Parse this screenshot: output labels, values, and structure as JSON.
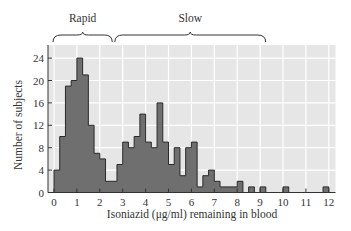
{
  "chart_data": {
    "type": "bar",
    "subtype": "histogram",
    "title": "",
    "xlabel": "Isoniazid (μg/ml) remaining in blood",
    "ylabel": "Number of subjects",
    "bin_width": 0.25,
    "xlim": [
      0,
      12.25
    ],
    "ylim": [
      0,
      25
    ],
    "xticks": [
      0,
      1,
      2,
      3,
      4,
      5,
      6,
      7,
      8,
      9,
      10,
      11,
      12
    ],
    "yticks": [
      0,
      4,
      8,
      12,
      16,
      20,
      24
    ],
    "grid": true,
    "bins": [
      {
        "x0": 0.0,
        "count": 4
      },
      {
        "x0": 0.25,
        "count": 10
      },
      {
        "x0": 0.5,
        "count": 19
      },
      {
        "x0": 0.75,
        "count": 20
      },
      {
        "x0": 1.0,
        "count": 24
      },
      {
        "x0": 1.25,
        "count": 21
      },
      {
        "x0": 1.5,
        "count": 12
      },
      {
        "x0": 1.75,
        "count": 7
      },
      {
        "x0": 2.0,
        "count": 6
      },
      {
        "x0": 2.25,
        "count": 2
      },
      {
        "x0": 2.5,
        "count": 2
      },
      {
        "x0": 2.75,
        "count": 5
      },
      {
        "x0": 3.0,
        "count": 9
      },
      {
        "x0": 3.25,
        "count": 8
      },
      {
        "x0": 3.5,
        "count": 10
      },
      {
        "x0": 3.75,
        "count": 14
      },
      {
        "x0": 4.0,
        "count": 9
      },
      {
        "x0": 4.25,
        "count": 8
      },
      {
        "x0": 4.5,
        "count": 16
      },
      {
        "x0": 4.75,
        "count": 9
      },
      {
        "x0": 5.0,
        "count": 5
      },
      {
        "x0": 5.25,
        "count": 8
      },
      {
        "x0": 5.5,
        "count": 3
      },
      {
        "x0": 5.75,
        "count": 8
      },
      {
        "x0": 6.0,
        "count": 9
      },
      {
        "x0": 6.25,
        "count": 1
      },
      {
        "x0": 6.5,
        "count": 3
      },
      {
        "x0": 6.75,
        "count": 4
      },
      {
        "x0": 7.0,
        "count": 2
      },
      {
        "x0": 7.25,
        "count": 1
      },
      {
        "x0": 7.5,
        "count": 1
      },
      {
        "x0": 7.75,
        "count": 1
      },
      {
        "x0": 8.0,
        "count": 2
      },
      {
        "x0": 8.5,
        "count": 1
      },
      {
        "x0": 9.0,
        "count": 1
      },
      {
        "x0": 10.0,
        "count": 1
      },
      {
        "x0": 11.75,
        "count": 1
      }
    ],
    "annotations": [
      {
        "label": "Rapid",
        "x_from": 0.0,
        "x_to": 2.5
      },
      {
        "label": "Slow",
        "x_from": 2.7,
        "x_to": 9.2
      }
    ],
    "colors": {
      "bar_fill": "#6f6f6f",
      "bar_edge": "#2a2a2a",
      "plot_bg": "#e6e6e6",
      "grid": "#ffffff"
    }
  }
}
